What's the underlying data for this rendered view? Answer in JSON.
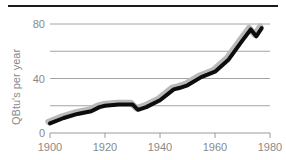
{
  "figure": {
    "top_rule_color": "#1a1a1a",
    "background_color": "#ffffff"
  },
  "chart_data": {
    "type": "line",
    "title": "",
    "subtitle": "",
    "xlabel": "",
    "ylabel": "QBtu's per year",
    "xlim": [
      1900,
      1980
    ],
    "ylim": [
      0,
      80
    ],
    "xticks": [
      1900,
      1920,
      1940,
      1960,
      1980
    ],
    "xtick_labels": [
      "1900",
      "1920",
      "1940",
      "1960",
      "1980"
    ],
    "yticks": [
      0,
      20,
      40,
      60,
      80
    ],
    "ytick_labels": [
      "0",
      "",
      "40",
      "",
      "80"
    ],
    "gridlines_y": [
      20,
      40,
      60,
      80
    ],
    "grid": true,
    "legend": false,
    "legend_position": "none",
    "line_color": "#0d0d0d",
    "shadow_color": "#b9b9b9",
    "tick_label_color": "#8a8a8a",
    "series": [
      {
        "name": "QBtu's per year",
        "x": [
          1900,
          1905,
          1910,
          1915,
          1918,
          1920,
          1925,
          1930,
          1932,
          1935,
          1940,
          1945,
          1947,
          1950,
          1955,
          1960,
          1965,
          1970,
          1973,
          1975,
          1977
        ],
        "values": [
          7,
          11,
          14,
          16,
          19,
          20,
          21,
          21,
          17,
          19,
          24,
          32,
          33,
          35,
          41,
          45,
          54,
          68,
          76,
          71,
          77
        ]
      }
    ],
    "annotations": []
  },
  "axis": {
    "y_title": "QBtu's per year",
    "y_labels": {
      "zero": "0",
      "forty": "40",
      "eighty": "80"
    },
    "x_labels": {
      "t1900": "1900",
      "t1920": "1920",
      "t1940": "1940",
      "t1960": "1960",
      "t1980": "1980"
    }
  }
}
